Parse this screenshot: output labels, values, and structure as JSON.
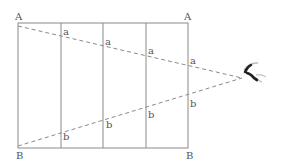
{
  "diagram": {
    "type": "perspective-convergence",
    "colors": {
      "frame": "#8a8a8a",
      "dashed": "#8a8a8a",
      "label": "#555555",
      "eye": "#222222"
    },
    "rect": {
      "left": 18,
      "top": 23,
      "right": 188,
      "bottom": 148
    },
    "dividers_x": [
      61,
      103,
      146
    ],
    "vanishing_point": {
      "x": 242,
      "y": 78
    },
    "labels": {
      "corner_top_left": "A",
      "corner_top_right": "A",
      "corner_bottom_left": "B",
      "corner_bottom_right": "B",
      "top_marks": [
        "a",
        "a",
        "a",
        "a"
      ],
      "bottom_marks": [
        "b",
        "b",
        "b",
        "b"
      ]
    },
    "icon": "eye-icon"
  }
}
